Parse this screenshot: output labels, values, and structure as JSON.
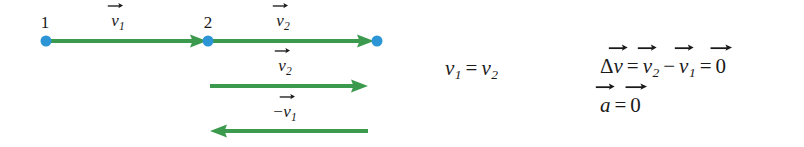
{
  "figure": {
    "background_color": "#ffffff",
    "arrow_color": "#3b9a4e",
    "dot_color": "#2b95d6",
    "text_color": "#1a1a1a"
  },
  "points": [
    {
      "id": "point-1",
      "label": "1",
      "x": 46,
      "y": 41,
      "label_x": 45,
      "label_y": 14
    },
    {
      "id": "point-2",
      "label": "2",
      "x": 208,
      "y": 41,
      "label_x": 208,
      "label_y": 14
    },
    {
      "id": "point-3",
      "label": "",
      "x": 377,
      "y": 41,
      "label_x": 377,
      "label_y": 14
    }
  ],
  "arrows": [
    {
      "id": "arrow-v1",
      "label_symbol": "v",
      "label_subscript": "1",
      "label_prefix": "",
      "label_text": "v⃗1",
      "direction": "right",
      "x_start": 48,
      "x_end": 207,
      "y": 41,
      "label_x": 118,
      "label_y": 12
    },
    {
      "id": "arrow-v2-top",
      "label_symbol": "v",
      "label_subscript": "2",
      "label_prefix": "",
      "label_text": "v⃗2",
      "direction": "right",
      "x_start": 212,
      "x_end": 374,
      "y": 41,
      "label_x": 283,
      "label_y": 12
    },
    {
      "id": "arrow-v2-second",
      "label_symbol": "v",
      "label_subscript": "2",
      "label_prefix": "",
      "label_text": "v⃗2",
      "direction": "right",
      "x_start": 210,
      "x_end": 368,
      "y": 86,
      "label_x": 285,
      "label_y": 57
    },
    {
      "id": "arrow-minus-v1",
      "label_symbol": "v",
      "label_subscript": "1",
      "label_prefix": "−",
      "label_text": "−v⃗1",
      "direction": "left",
      "x_start": 210,
      "x_end": 368,
      "y": 131,
      "label_x": 285,
      "label_y": 103
    }
  ],
  "equations": [
    {
      "id": "equation-speeds-equal",
      "text": "v₁ = v₂",
      "x": 445,
      "y": 58,
      "parts": {
        "lhs_symbol": "v",
        "lhs_sub": "1",
        "operator": "=",
        "rhs_symbol": "v",
        "rhs_sub": "2"
      }
    },
    {
      "id": "equation-delta-v",
      "text": "Δv⃗ = v⃗₂ − v⃗₁ = 0⃗",
      "x": 600,
      "y": 56,
      "parts": {
        "delta": "Δ",
        "v": "v",
        "eq1": "=",
        "v2_symbol": "v",
        "v2_sub": "2",
        "minus": "−",
        "v1_symbol": "v",
        "v1_sub": "1",
        "eq2": "=",
        "zero": "0"
      }
    },
    {
      "id": "equation-acceleration-zero",
      "text": "a⃗ = 0⃗",
      "x": 600,
      "y": 95,
      "parts": {
        "a": "a",
        "operator": "=",
        "zero": "0"
      }
    }
  ]
}
